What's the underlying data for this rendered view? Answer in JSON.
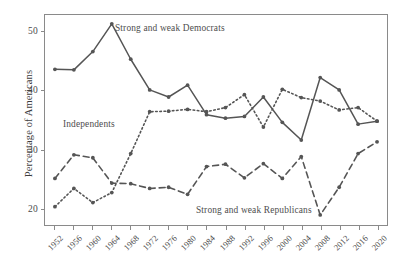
{
  "chart_data": {
    "type": "line",
    "title": "",
    "subtitle": "",
    "xlabel": "",
    "ylabel": "Percentage of Americans",
    "ylim": [
      17.2,
      52.8
    ],
    "xlim": [
      1950,
      2022
    ],
    "yticks": [
      20,
      30,
      40,
      50
    ],
    "ytick_labels": [
      "20",
      "30",
      "40",
      "50"
    ],
    "grid": false,
    "legend_position": "inline-annotations",
    "categories": [
      1952,
      1956,
      1960,
      1964,
      1968,
      1972,
      1976,
      1980,
      1984,
      1988,
      1992,
      1996,
      2000,
      2004,
      2008,
      2012,
      2016,
      2020
    ],
    "xtick_labels": [
      "1952",
      "1956",
      "1960",
      "1964",
      "1968",
      "1972",
      "1976",
      "1980",
      "1984",
      "1988",
      "1992",
      "1996",
      "2000",
      "2004",
      "2008",
      "2012",
      "2016",
      "2020"
    ],
    "series": [
      {
        "name": "Strong and weak Democrats",
        "style": "solid",
        "color": "#555555",
        "annotation": "Strong and weak Democrats",
        "values": [
          43.6,
          43.5,
          46.6,
          51.3,
          45.3,
          40.1,
          38.9,
          40.9,
          35.9,
          35.3,
          35.6,
          38.9,
          34.6,
          31.6,
          42.2,
          40.1,
          34.3,
          34.8
        ]
      },
      {
        "name": "Independents",
        "style": "dotted",
        "color": "#555555",
        "annotation": "Independents",
        "values": [
          20.3,
          23.4,
          21.0,
          22.7,
          29.3,
          36.4,
          36.5,
          36.8,
          36.4,
          37.1,
          39.3,
          33.8,
          40.2,
          38.8,
          38.2,
          36.7,
          37.1,
          34.8
        ]
      },
      {
        "name": "Strong and weak Republicans",
        "style": "dashed",
        "color": "#555555",
        "annotation": "Strong and weak Republicans",
        "values": [
          25.1,
          29.1,
          28.6,
          24.3,
          24.2,
          23.4,
          23.6,
          22.4,
          27.1,
          27.5,
          25.2,
          27.6,
          25.1,
          28.8,
          18.9,
          23.6,
          29.3,
          31.3
        ]
      }
    ]
  },
  "axis": {
    "y_title": "Percentage of Americans"
  }
}
